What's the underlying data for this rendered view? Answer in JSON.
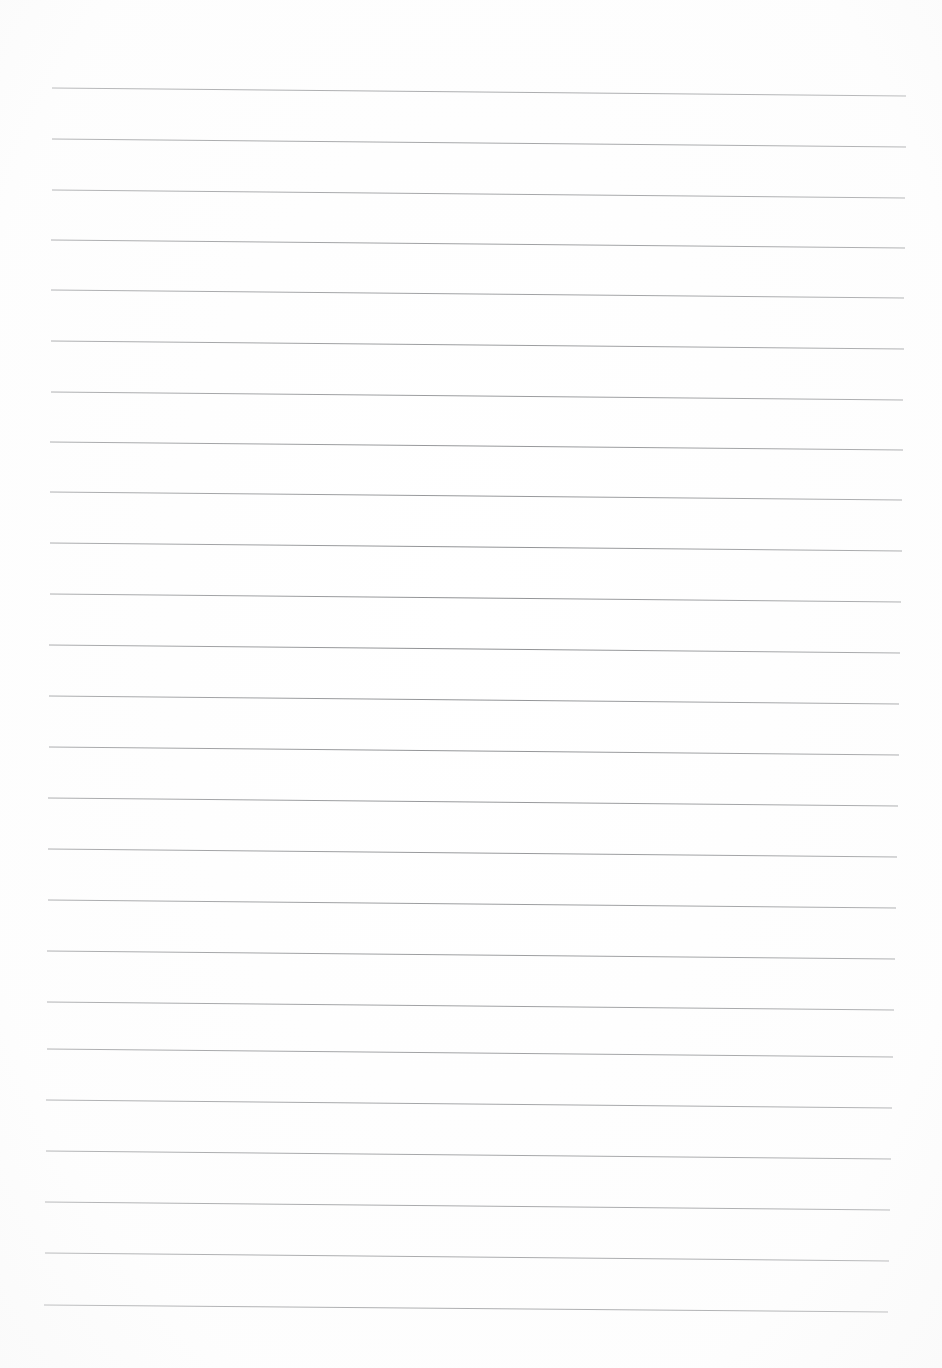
{
  "document": {
    "kind": "scanned-lined-paper",
    "title": "Blank Ruled Notebook Page",
    "page_width": 942,
    "page_height": 1368,
    "background_color": "#ffffff",
    "content_text": "",
    "note": "No handwriting, printed text, headers or marks are present on the sheet."
  },
  "ruling": {
    "line_color": "#7f8184",
    "line_color_faint": "#9ea0a3",
    "line_width_px": 1,
    "line_count": 25,
    "line_spacing_px": 51,
    "first_line_left_y": 88,
    "last_line_left_y": 1305,
    "skew_drop_px": 8,
    "left_margin_px": 52,
    "right_end_px": 906,
    "lines": [
      {
        "index": 1,
        "x1": 52,
        "y1": 88,
        "x2": 906,
        "y2": 96,
        "opacity": 0.82
      },
      {
        "index": 2,
        "x1": 52,
        "y1": 139,
        "x2": 906,
        "y2": 147,
        "opacity": 0.86
      },
      {
        "index": 3,
        "x1": 52,
        "y1": 190,
        "x2": 905,
        "y2": 198,
        "opacity": 0.84
      },
      {
        "index": 4,
        "x1": 51,
        "y1": 240,
        "x2": 905,
        "y2": 248,
        "opacity": 0.88
      },
      {
        "index": 5,
        "x1": 51,
        "y1": 290,
        "x2": 904,
        "y2": 298,
        "opacity": 0.85
      },
      {
        "index": 6,
        "x1": 51,
        "y1": 341,
        "x2": 904,
        "y2": 349,
        "opacity": 0.87
      },
      {
        "index": 7,
        "x1": 51,
        "y1": 392,
        "x2": 903,
        "y2": 400,
        "opacity": 0.86
      },
      {
        "index": 8,
        "x1": 50,
        "y1": 442,
        "x2": 903,
        "y2": 450,
        "opacity": 0.88
      },
      {
        "index": 9,
        "x1": 50,
        "y1": 492,
        "x2": 902,
        "y2": 500,
        "opacity": 0.86
      },
      {
        "index": 10,
        "x1": 50,
        "y1": 543,
        "x2": 902,
        "y2": 551,
        "opacity": 0.88
      },
      {
        "index": 11,
        "x1": 50,
        "y1": 594,
        "x2": 901,
        "y2": 602,
        "opacity": 0.87
      },
      {
        "index": 12,
        "x1": 49,
        "y1": 645,
        "x2": 900,
        "y2": 653,
        "opacity": 0.89
      },
      {
        "index": 13,
        "x1": 49,
        "y1": 696,
        "x2": 899,
        "y2": 704,
        "opacity": 0.88
      },
      {
        "index": 14,
        "x1": 49,
        "y1": 747,
        "x2": 899,
        "y2": 755,
        "opacity": 0.89
      },
      {
        "index": 15,
        "x1": 48,
        "y1": 798,
        "x2": 898,
        "y2": 806,
        "opacity": 0.88
      },
      {
        "index": 16,
        "x1": 48,
        "y1": 849,
        "x2": 897,
        "y2": 857,
        "opacity": 0.89
      },
      {
        "index": 17,
        "x1": 48,
        "y1": 900,
        "x2": 896,
        "y2": 908,
        "opacity": 0.88
      },
      {
        "index": 18,
        "x1": 47,
        "y1": 951,
        "x2": 895,
        "y2": 959,
        "opacity": 0.89
      },
      {
        "index": 19,
        "x1": 47,
        "y1": 1002,
        "x2": 894,
        "y2": 1010,
        "opacity": 0.88
      },
      {
        "index": 20,
        "x1": 47,
        "y1": 1049,
        "x2": 893,
        "y2": 1057,
        "opacity": 0.89
      },
      {
        "index": 21,
        "x1": 46,
        "y1": 1100,
        "x2": 892,
        "y2": 1108,
        "opacity": 0.88
      },
      {
        "index": 22,
        "x1": 46,
        "y1": 1151,
        "x2": 891,
        "y2": 1159,
        "opacity": 0.89
      },
      {
        "index": 23,
        "x1": 45,
        "y1": 1202,
        "x2": 890,
        "y2": 1210,
        "opacity": 0.88
      },
      {
        "index": 24,
        "x1": 45,
        "y1": 1253,
        "x2": 889,
        "y2": 1261,
        "opacity": 0.89
      },
      {
        "index": 25,
        "x1": 44,
        "y1": 1305,
        "x2": 888,
        "y2": 1312,
        "opacity": 0.88
      }
    ]
  }
}
